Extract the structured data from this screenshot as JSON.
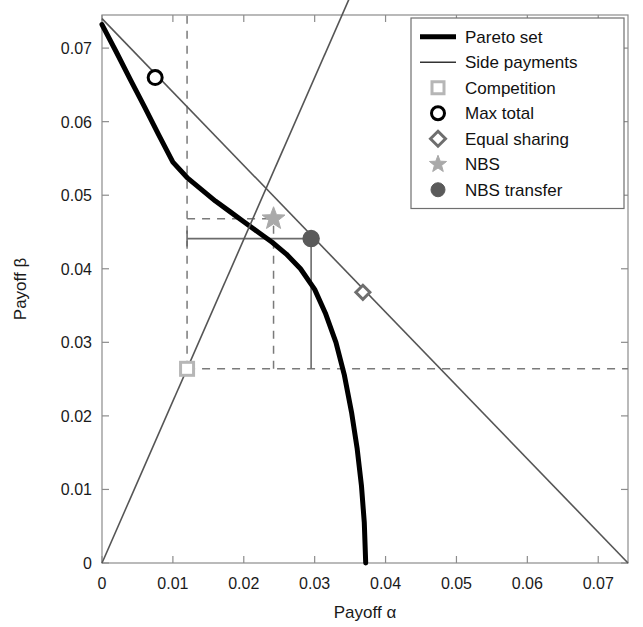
{
  "chart_data": {
    "type": "line",
    "title": "",
    "xlabel": "Payoff α",
    "ylabel": "Payoff β",
    "xlim": [
      0,
      0.0742
    ],
    "ylim": [
      0,
      0.0745
    ],
    "xticks": [
      0,
      0.01,
      0.02,
      0.03,
      0.04,
      0.05,
      0.06,
      0.07
    ],
    "xticklabels": [
      "0",
      "0.01",
      "0.02",
      "0.03",
      "0.04",
      "0.05",
      "0.06",
      "0.07"
    ],
    "yticks": [
      0,
      0.01,
      0.02,
      0.03,
      0.04,
      0.05,
      0.06,
      0.07
    ],
    "yticklabels": [
      "0",
      "0.01",
      "0.02",
      "0.03",
      "0.04",
      "0.05",
      "0.06",
      "0.07"
    ],
    "grid": false,
    "legend_position": "top-right",
    "series": [
      {
        "name": "Pareto set",
        "type": "line",
        "style": "solid-thick",
        "color": "#000000",
        "width": 5,
        "points": [
          [
            0.0,
            0.0732
          ],
          [
            0.002,
            0.0695
          ],
          [
            0.004,
            0.0657
          ],
          [
            0.006,
            0.062
          ],
          [
            0.0075,
            0.066
          ],
          [
            0.008,
            0.0582
          ],
          [
            0.01,
            0.0545
          ],
          [
            0.012,
            0.0524
          ],
          [
            0.014,
            0.0508
          ],
          [
            0.016,
            0.0492
          ],
          [
            0.018,
            0.0478
          ],
          [
            0.02,
            0.0464
          ],
          [
            0.022,
            0.045
          ],
          [
            0.024,
            0.0436
          ],
          [
            0.026,
            0.042
          ],
          [
            0.028,
            0.04
          ],
          [
            0.03,
            0.0372
          ],
          [
            0.0315,
            0.034
          ],
          [
            0.033,
            0.03
          ],
          [
            0.0342,
            0.0255
          ],
          [
            0.0352,
            0.0205
          ],
          [
            0.036,
            0.0155
          ],
          [
            0.0366,
            0.0105
          ],
          [
            0.037,
            0.0055
          ],
          [
            0.0372,
            0.0
          ]
        ]
      },
      {
        "name": "Side payments",
        "type": "line",
        "style": "solid-thin",
        "color": "#555555",
        "width": 1.6,
        "points": [
          [
            0.0,
            0.074
          ],
          [
            0.0742,
            0.0
          ]
        ]
      },
      {
        "name": "Transfer ray",
        "type": "line",
        "style": "solid-thin",
        "color": "#555555",
        "width": 1.6,
        "points": [
          [
            0.0,
            0.0
          ],
          [
            0.04,
            0.088
          ]
        ]
      }
    ],
    "markers": [
      {
        "name": "Competition",
        "shape": "square",
        "x": 0.012,
        "y": 0.0264,
        "color": "#b6b6b6",
        "filled": false,
        "size": 13
      },
      {
        "name": "Max total",
        "shape": "circle",
        "x": 0.0075,
        "y": 0.066,
        "color": "#000000",
        "filled": false,
        "size": 14
      },
      {
        "name": "Equal sharing",
        "shape": "diamond",
        "x": 0.0368,
        "y": 0.0368,
        "color": "#6e6e6e",
        "filled": false,
        "size": 14
      },
      {
        "name": "NBS",
        "shape": "star",
        "x": 0.0242,
        "y": 0.0468,
        "color": "#a9a9a9",
        "filled": true,
        "size": 20
      },
      {
        "name": "NBS transfer",
        "shape": "circle",
        "x": 0.0295,
        "y": 0.0441,
        "color": "#5a5a5a",
        "filled": true,
        "size": 16
      }
    ],
    "annotations": [
      {
        "name": "competition-vline",
        "type": "vline-dashed",
        "x": 0.012,
        "y0": 0.0264,
        "y1": 0.0745
      },
      {
        "name": "competition-hline",
        "type": "hline-dashed",
        "y": 0.0264,
        "x0": 0.012,
        "x1": 0.0742
      },
      {
        "name": "nbs-hline",
        "type": "hline-dashed",
        "y": 0.0468,
        "x0": 0.012,
        "x1": 0.0242
      },
      {
        "name": "nbs-vline",
        "type": "vline-dashed",
        "x": 0.0242,
        "y0": 0.0264,
        "y1": 0.0468
      },
      {
        "name": "transfer-bar",
        "type": "hline-capped",
        "y": 0.0441,
        "x0": 0.012,
        "x1": 0.0295
      },
      {
        "name": "transfer-vline",
        "type": "vline-solid",
        "x": 0.0295,
        "y0": 0.0264,
        "y1": 0.0441
      }
    ],
    "legend": [
      {
        "label": "Pareto set",
        "glyph": "line-thick",
        "color": "#000000"
      },
      {
        "label": "Side payments",
        "glyph": "line-thin",
        "color": "#333333"
      },
      {
        "label": "Competition",
        "glyph": "square-open",
        "color": "#b6b6b6"
      },
      {
        "label": "Max total",
        "glyph": "circle-open",
        "color": "#000000"
      },
      {
        "label": "Equal sharing",
        "glyph": "diamond-open",
        "color": "#6e6e6e"
      },
      {
        "label": "NBS",
        "glyph": "star-filled",
        "color": "#a9a9a9"
      },
      {
        "label": "NBS transfer",
        "glyph": "circle-filled",
        "color": "#5a5a5a"
      }
    ]
  }
}
